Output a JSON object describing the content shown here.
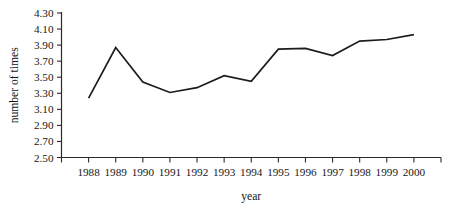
{
  "chart_data": {
    "type": "line",
    "title": "",
    "xlabel": "year",
    "ylabel": "number of times",
    "categories": [
      "1988",
      "1989",
      "1990",
      "1991",
      "1992",
      "1993",
      "1994",
      "1995",
      "1996",
      "1997",
      "1998",
      "1999",
      "2000"
    ],
    "x": [
      1988,
      1989,
      1990,
      1991,
      1992,
      1993,
      1994,
      1995,
      1996,
      1997,
      1998,
      1999,
      2000
    ],
    "values": [
      3.24,
      3.87,
      3.44,
      3.31,
      3.37,
      3.52,
      3.45,
      3.85,
      3.86,
      3.77,
      3.95,
      3.97,
      4.03
    ],
    "series": [
      {
        "name": "number of times",
        "values": [
          3.24,
          3.87,
          3.44,
          3.31,
          3.37,
          3.52,
          3.45,
          3.85,
          3.86,
          3.77,
          3.95,
          3.97,
          4.03
        ]
      }
    ],
    "ylim": [
      2.5,
      4.3
    ],
    "ytick_labels": [
      "4.30",
      "4.10",
      "3.90",
      "3.70",
      "3.50",
      "3.30",
      "3.10",
      "2.90",
      "2.70",
      "2.50"
    ],
    "ytick_values": [
      4.3,
      4.1,
      3.9,
      3.7,
      3.5,
      3.3,
      3.1,
      2.9,
      2.7,
      2.5
    ],
    "ytick_step": 0.2,
    "grid": false,
    "legend": "none",
    "line_color": "#1c1c1c",
    "axis_color": "#2a2a2a",
    "background_color": "#ffffff",
    "markers": false
  }
}
